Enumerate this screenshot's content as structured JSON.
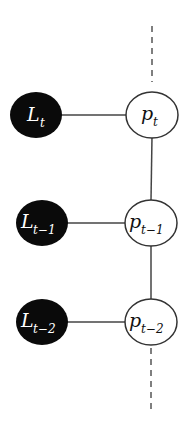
{
  "diagram": {
    "colors": {
      "observed_fill": "#0a0a0a",
      "latent_fill": "#ffffff",
      "stroke": "#333333",
      "observed_text": "#ffffff",
      "latent_text": "#111111"
    },
    "rows": [
      {
        "observed": {
          "base": "L",
          "sub": "t"
        },
        "latent": {
          "base": "p",
          "sub": "t"
        }
      },
      {
        "observed": {
          "base": "L",
          "sub": "t−1"
        },
        "latent": {
          "base": "p",
          "sub": "t−1"
        }
      },
      {
        "observed": {
          "base": "L",
          "sub": "t−2"
        },
        "latent": {
          "base": "p",
          "sub": "t−2"
        }
      }
    ]
  }
}
